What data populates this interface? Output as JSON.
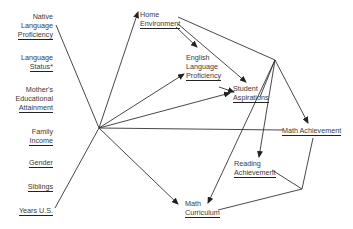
{
  "diagram": {
    "type": "path model",
    "left_variables": [
      {
        "lines": [
          "Native",
          "Language"
        ],
        "underlined": "Proficiency"
      },
      {
        "lines": [
          "Language"
        ],
        "underlined": "Status*"
      },
      {
        "lines": [
          "Mother's",
          "Educational"
        ],
        "underlined": "Attainment"
      },
      {
        "lines": [
          "Family"
        ],
        "underlined": "Income"
      },
      {
        "lines": [],
        "underlined": "Gender"
      },
      {
        "lines": [],
        "underlined": "Siblings"
      },
      {
        "lines": [],
        "underlined": "Years U.S."
      }
    ],
    "nodes": {
      "home": {
        "line1": "Home",
        "underlined": "Environment"
      },
      "english": {
        "line1": "English",
        "line2": "Language",
        "underlined": "Proficiency"
      },
      "aspirations": {
        "line1": "Student",
        "underlined": "Aspirations"
      },
      "math_ach": {
        "underlined": "Math Achievement"
      },
      "reading": {
        "line1": "Reading",
        "underlined": "Achievement"
      },
      "math_curr": {
        "line1": "Math",
        "underlined": "Curriculum"
      }
    },
    "edges": [
      {
        "from": "background_hub",
        "to": "Home Environment",
        "arrow": true
      },
      {
        "from": "background_hub",
        "to": "English Language Proficiency",
        "arrow": true
      },
      {
        "from": "background_hub",
        "to": "Student Aspirations",
        "arrow": true
      },
      {
        "from": "background_hub",
        "to": "Math Achievement",
        "arrow": false
      },
      {
        "from": "background_hub",
        "to": "Math Curriculum",
        "arrow": true
      },
      {
        "from": "Home Environment",
        "to": "English Language Proficiency",
        "arrow": true
      },
      {
        "from": "Home Environment",
        "to": "Student Aspirations",
        "arrow": true
      },
      {
        "from": "Home Environment",
        "to": "right_hub",
        "arrow": false
      },
      {
        "from": "English Language Proficiency",
        "to": "Student Aspirations",
        "arrow": true
      },
      {
        "from": "right_hub",
        "to": "Student Aspirations",
        "arrow": false
      },
      {
        "from": "right_hub",
        "to": "Math Achievement",
        "arrow": true
      },
      {
        "from": "right_hub",
        "to": "Reading Achievement",
        "arrow": true
      },
      {
        "from": "right_hub",
        "to": "Math Curriculum",
        "arrow": true
      },
      {
        "from": "Math Achievement",
        "to": "lower_junction",
        "arrow": false
      },
      {
        "from": "Reading Achievement",
        "to": "lower_junction",
        "arrow": false
      },
      {
        "from": "Math Curriculum",
        "to": "lower_junction",
        "arrow": false
      }
    ]
  }
}
